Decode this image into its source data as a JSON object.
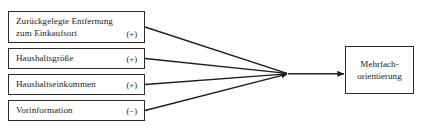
{
  "diagram": {
    "type": "path-model",
    "antecedents": [
      {
        "id": "distance",
        "label_line1": "Zurückgelegte Entfernung",
        "label_line2": "zum Einkaufsort",
        "sign": "(+)"
      },
      {
        "id": "household-size",
        "label_line1": "Haushaltsgröße",
        "label_line2": "",
        "sign": "(+)"
      },
      {
        "id": "household-income",
        "label_line1": "Haushaltseinkommen",
        "label_line2": "",
        "sign": "(+)"
      },
      {
        "id": "prior-information",
        "label_line1": "Vorinformation",
        "label_line2": "",
        "sign": "(−)"
      }
    ],
    "outcome": {
      "id": "multi-orientation",
      "label_line1": "Mehrfach-",
      "label_line2": "orientierung"
    },
    "colors": {
      "stroke": "#2b2b2b",
      "text": "#1d1d1d",
      "background": "#ffffff"
    }
  }
}
